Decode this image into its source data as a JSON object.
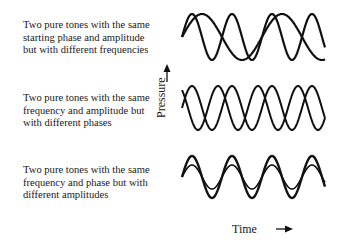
{
  "descriptions": {
    "top": {
      "lines": [
        "Two pure tones with the same",
        "starting phase and amplitude",
        "but with different frequencies"
      ]
    },
    "middle": {
      "lines": [
        "Two pure tones with the same",
        "frequency and amplitude but",
        "with different phases"
      ]
    },
    "bottom": {
      "lines": [
        "Two pure tones with the same",
        "frequency and phase but with",
        "different amplitudes"
      ]
    }
  },
  "axes": {
    "y_label": "Pressure",
    "y_arrow": "up-arrow",
    "x_label": "Time",
    "x_arrow": "right-arrow"
  },
  "panels": [
    {
      "name": "different-frequencies",
      "x_start": 182,
      "x_end": 325,
      "midline": 37,
      "waves": [
        {
          "amplitude": 23,
          "period": 80,
          "phase": 0,
          "stroke": 2.2
        },
        {
          "amplitude": 23,
          "period": 40,
          "phase": 0,
          "stroke": 2.2
        }
      ]
    },
    {
      "name": "different-phases",
      "x_start": 182,
      "x_end": 325,
      "midline": 108,
      "waves": [
        {
          "amplitude": 22,
          "period": 40,
          "phase": 0.35,
          "stroke": 2.0
        },
        {
          "amplitude": 22,
          "period": 40,
          "phase": 0.0,
          "stroke": 2.0
        }
      ]
    },
    {
      "name": "different-amplitudes",
      "x_start": 182,
      "x_end": 325,
      "midline": 177,
      "waves": [
        {
          "amplitude": 21,
          "period": 40,
          "phase": 0,
          "stroke": 2.4
        },
        {
          "amplitude": 12,
          "period": 40,
          "phase": 0,
          "stroke": 1.6
        }
      ]
    }
  ],
  "colors": {
    "line": "#111111",
    "text": "#1a1a1a",
    "background": "#ffffff"
  }
}
